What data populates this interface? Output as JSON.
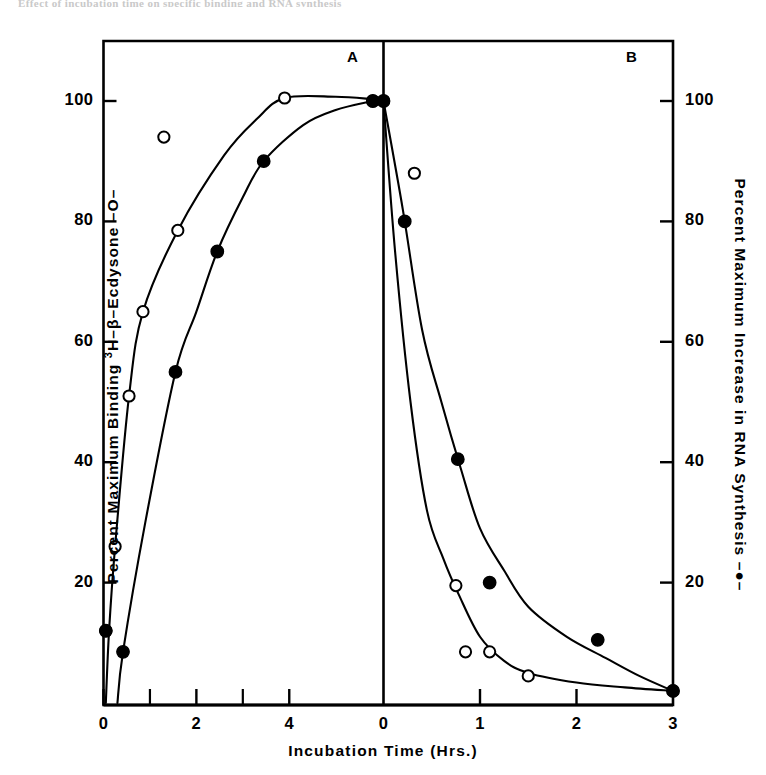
{
  "figure": {
    "top_cut_text": "Effect of incubation time on specific binding and RNA synthesis",
    "panels": [
      {
        "id": "A",
        "label": "A"
      },
      {
        "id": "B",
        "label": "B"
      }
    ],
    "axes": {
      "x_title": "Incubation  Time  (Hrs.)",
      "y_left_title_pre": "Percent  Maximum  Binding   ",
      "y_left_title_iso": "3",
      "y_left_title_post": "H–β–Ecdysone  –O–",
      "y_left_title_full": "Percent  Maximum  Binding   3H–β–Ecdysone  –O–",
      "y_right_title": "Percent  Maximum  Increase  in  RNA  Synthesis –●–",
      "y_ticklabels": [
        "100",
        "80",
        "60",
        "40",
        "20"
      ],
      "y_tickvalues": [
        100,
        80,
        60,
        40,
        20
      ],
      "panelA_xticklabels": [
        "0",
        "2",
        "4"
      ],
      "panelA_xtickvalues": [
        0,
        2,
        4
      ],
      "panelA_xminorticks": [
        1,
        3
      ],
      "panelB_xticklabels": [
        "0",
        "1",
        "2",
        "3"
      ],
      "panelB_xtickvalues": [
        0,
        1,
        2,
        3
      ]
    },
    "colors": {
      "ink": "#000000",
      "paper": "#ffffff"
    }
  },
  "chart_data": [
    {
      "type": "scatter",
      "panel": "A",
      "title": "A",
      "xlabel": "Incubation Time (Hrs.)",
      "ylabel": "Percent Maximum Binding 3H-β-Ecdysone",
      "xlim": [
        0,
        5.9
      ],
      "ylim": [
        0,
        112
      ],
      "grid": false,
      "legend": "none",
      "series": [
        {
          "name": "Percent Maximum Binding 3H-β-Ecdysone",
          "marker": "open-circle",
          "x": [
            0.05,
            0.25,
            0.55,
            0.85,
            1.3,
            1.6,
            3.9,
            5.8
          ],
          "y": [
            12,
            26,
            51,
            65,
            94,
            78.5,
            100.5,
            100
          ]
        },
        {
          "name": "Percent Maximum Increase in RNA Synthesis",
          "marker": "filled-circle",
          "x": [
            0.05,
            0.42,
            1.55,
            2.45,
            3.45,
            5.8
          ],
          "y": [
            12,
            8.5,
            55,
            75,
            90,
            100
          ]
        }
      ],
      "curves": [
        {
          "name": "open-circle-fit",
          "points": [
            [
              0.05,
              0
            ],
            [
              0.12,
              12
            ],
            [
              0.25,
              26
            ],
            [
              0.55,
              51
            ],
            [
              0.85,
              65
            ],
            [
              1.6,
              78.5
            ],
            [
              2.6,
              91
            ],
            [
              3.3,
              97
            ],
            [
              3.9,
              100.5
            ],
            [
              5.0,
              100.7
            ],
            [
              5.8,
              100.3
            ]
          ]
        },
        {
          "name": "filled-circle-fit",
          "points": [
            [
              0.3,
              0
            ],
            [
              0.42,
              8.5
            ],
            [
              0.9,
              30
            ],
            [
              1.55,
              55
            ],
            [
              2.0,
              65
            ],
            [
              2.45,
              75
            ],
            [
              3.0,
              84
            ],
            [
              3.45,
              90
            ],
            [
              4.3,
              96
            ],
            [
              5.0,
              98.5
            ],
            [
              5.8,
              100
            ]
          ]
        }
      ]
    },
    {
      "type": "scatter",
      "panel": "B",
      "title": "B",
      "xlabel": "Incubation Time (Hrs.)",
      "ylabel": "Percent Maximum Increase in RNA Synthesis",
      "xlim": [
        0,
        3
      ],
      "ylim": [
        0,
        112
      ],
      "grid": false,
      "legend": "none",
      "series": [
        {
          "name": "Percent Maximum Binding 3H-β-Ecdysone",
          "marker": "open-circle",
          "x": [
            0.0,
            0.32,
            0.75,
            0.85,
            1.1,
            1.5,
            3.0
          ],
          "y": [
            100,
            88,
            19.5,
            8.5,
            8.5,
            4.5,
            2
          ]
        },
        {
          "name": "Percent Maximum Increase in RNA Synthesis",
          "marker": "filled-circle",
          "x": [
            0.0,
            0.22,
            0.77,
            1.1,
            2.22,
            3.0
          ],
          "y": [
            100,
            80,
            40.5,
            20,
            10.5,
            2
          ]
        }
      ],
      "curves": [
        {
          "name": "open-circle-decay",
          "points": [
            [
              0.0,
              100
            ],
            [
              0.12,
              75
            ],
            [
              0.28,
              50
            ],
            [
              0.45,
              32
            ],
            [
              0.62,
              24
            ],
            [
              0.78,
              18
            ],
            [
              1.0,
              11
            ],
            [
              1.25,
              7
            ],
            [
              1.5,
              5
            ],
            [
              2.0,
              3.4
            ],
            [
              2.5,
              2.6
            ],
            [
              3.0,
              2
            ]
          ]
        },
        {
          "name": "filled-circle-decay",
          "points": [
            [
              0.0,
              100
            ],
            [
              0.2,
              82
            ],
            [
              0.4,
              62
            ],
            [
              0.6,
              50
            ],
            [
              0.8,
              39
            ],
            [
              1.0,
              29
            ],
            [
              1.25,
              22
            ],
            [
              1.5,
              16
            ],
            [
              1.9,
              11
            ],
            [
              2.3,
              7.5
            ],
            [
              2.65,
              4.5
            ],
            [
              3.0,
              2
            ]
          ]
        }
      ]
    }
  ]
}
